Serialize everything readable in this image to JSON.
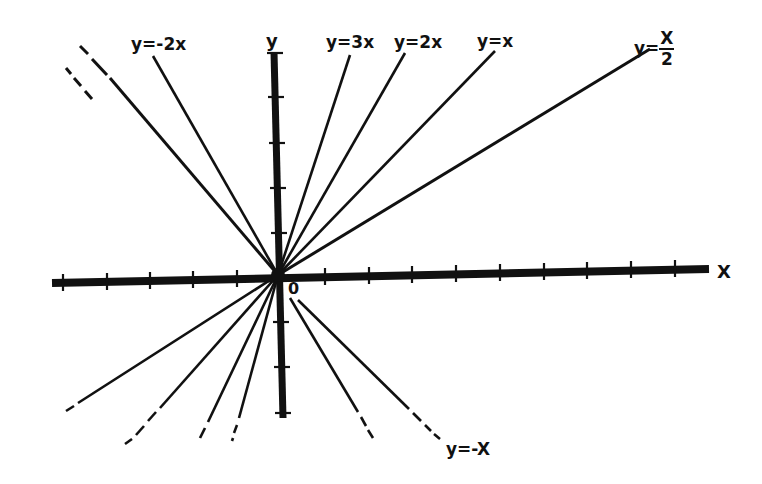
{
  "diagram": {
    "type": "line-graph-family",
    "origin": {
      "label": "0",
      "px": [
        278,
        275
      ]
    },
    "axes": {
      "x": {
        "label": "X",
        "ticks_left": 5,
        "ticks_right": 9,
        "tick_spacing_px": 44
      },
      "y": {
        "label": "y",
        "ticks_up": 5,
        "ticks_down": 3,
        "tick_spacing_px": 45
      }
    },
    "colors": {
      "ink": "#111111",
      "background": "#ffffff"
    },
    "lines": [
      {
        "label": "y=-2x",
        "slope": -2,
        "eq_left": "y",
        "eq_sign": "=",
        "eq_right": "-2x"
      },
      {
        "label": "y=3x",
        "slope": 3,
        "eq_left": "y",
        "eq_sign": "=",
        "eq_right": "3x"
      },
      {
        "label": "y=2x",
        "slope": 2,
        "eq_left": "y",
        "eq_sign": "=",
        "eq_right": "2x"
      },
      {
        "label": "y=x",
        "slope": 1,
        "eq_left": "y",
        "eq_sign": "=",
        "eq_right": "x"
      },
      {
        "label": "y=x/2",
        "slope": 0.5,
        "eq_left": "y",
        "eq_sign": "=",
        "eq_num": "x",
        "eq_den": "2"
      },
      {
        "label": "y=-x",
        "slope": -1,
        "eq_left": "y",
        "eq_sign": "=",
        "eq_right": "-x"
      }
    ]
  },
  "labels": {
    "y_axis": "y",
    "x_axis": "X",
    "origin": "0",
    "neg2x": "y=-2x",
    "three_x": "y=3x",
    "two_x": "y=2x",
    "one_x": "y=x",
    "half_left": "y=",
    "half_num": "X",
    "half_den": "2",
    "neg_x": "y=-X"
  }
}
